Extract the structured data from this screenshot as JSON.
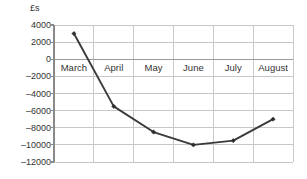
{
  "chart_data": {
    "type": "line",
    "title": "",
    "xlabel": "",
    "ylabel": "£s",
    "categories": [
      "March",
      "April",
      "May",
      "June",
      "July",
      "August"
    ],
    "values": [
      3000,
      -5500,
      -8500,
      -10000,
      -9500,
      -7000
    ],
    "series": [
      {
        "name": "",
        "values": [
          3000,
          -5500,
          -8500,
          -10000,
          -9500,
          -7000
        ]
      }
    ],
    "ylim": [
      -12000,
      4000
    ],
    "ytick_labels": [
      "4000",
      "2000",
      "0",
      "–2000",
      "–4000",
      "–6000",
      "–8000",
      "–10000",
      "–12000"
    ],
    "ytick_values": [
      4000,
      2000,
      0,
      -2000,
      -4000,
      -6000,
      -8000,
      -10000,
      -12000
    ],
    "grid": true,
    "legend": "none",
    "colors": {
      "line": "#3a3a3a",
      "marker": "#2d2d2d",
      "grid": "#c8c8c8",
      "axis": "#8a8a8a",
      "text": "#333333",
      "background": "#ffffff"
    }
  }
}
